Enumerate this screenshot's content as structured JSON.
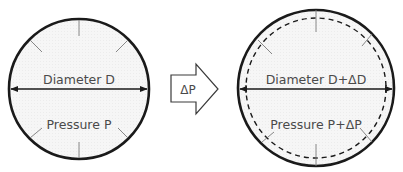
{
  "diagram": {
    "before": {
      "diameter_label": "Diameter D",
      "pressure_label": "Pressure P"
    },
    "transition": {
      "label": "ΔP"
    },
    "after": {
      "diameter_label": "Diameter D+ΔD",
      "pressure_label": "Pressure P+ΔP"
    },
    "colors": {
      "outline": "#1a1a1a",
      "fill": "#f4f4f4",
      "text": "#4a4a4a",
      "pressure_ticks": "#777777"
    }
  }
}
